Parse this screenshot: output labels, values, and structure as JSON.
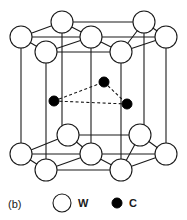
{
  "figure": {
    "panel_label": "(b)",
    "title": "",
    "type": "crystal-structure-diagram",
    "colors": {
      "line": "#1a1a1a",
      "atom_w_fill": "#ffffff",
      "atom_w_stroke": "#1a1a1a",
      "atom_c_fill": "#000000",
      "atom_c_stroke": "#000000",
      "background": "#ffffff",
      "dashed_bond": "#1a1a1a"
    }
  },
  "legend": {
    "items": [
      {
        "symbol": "open-circle",
        "label": "W"
      },
      {
        "symbol": "filled-circle",
        "label": "C"
      }
    ]
  },
  "chart_data": {
    "type": "scatter",
    "xlabel": "",
    "ylabel": "",
    "atoms": [
      {
        "element": "W",
        "layer": "top",
        "cx": 62,
        "cy": 22,
        "r": 11
      },
      {
        "element": "W",
        "layer": "top",
        "cx": 144,
        "cy": 22,
        "r": 11
      },
      {
        "element": "W",
        "layer": "top",
        "cx": 21,
        "cy": 37,
        "r": 11
      },
      {
        "element": "W",
        "layer": "top",
        "cx": 91,
        "cy": 37,
        "r": 11
      },
      {
        "element": "W",
        "layer": "top",
        "cx": 166,
        "cy": 37,
        "r": 11
      },
      {
        "element": "W",
        "layer": "top",
        "cx": 46,
        "cy": 52,
        "r": 11
      },
      {
        "element": "W",
        "layer": "top",
        "cx": 121,
        "cy": 52,
        "r": 11
      },
      {
        "element": "C",
        "layer": "middle",
        "cx": 104,
        "cy": 82,
        "r": 5
      },
      {
        "element": "C",
        "layer": "middle",
        "cx": 54,
        "cy": 101,
        "r": 5
      },
      {
        "element": "C",
        "layer": "middle",
        "cx": 127,
        "cy": 104,
        "r": 5
      },
      {
        "element": "W",
        "layer": "bottom",
        "cx": 68,
        "cy": 135,
        "r": 11
      },
      {
        "element": "W",
        "layer": "bottom",
        "cx": 140,
        "cy": 135,
        "r": 11
      },
      {
        "element": "W",
        "layer": "bottom",
        "cx": 21,
        "cy": 154,
        "r": 11
      },
      {
        "element": "W",
        "layer": "bottom",
        "cx": 91,
        "cy": 154,
        "r": 11
      },
      {
        "element": "W",
        "layer": "bottom",
        "cx": 166,
        "cy": 154,
        "r": 11
      },
      {
        "element": "W",
        "layer": "bottom",
        "cx": 46,
        "cy": 170,
        "r": 11
      },
      {
        "element": "W",
        "layer": "bottom",
        "cx": 121,
        "cy": 170,
        "r": 11
      }
    ],
    "vertical_edges": [
      {
        "x1": 21,
        "y1": 37,
        "x2": 21,
        "y2": 154
      },
      {
        "x1": 46,
        "y1": 52,
        "x2": 46,
        "y2": 170
      },
      {
        "x1": 62,
        "y1": 22,
        "x2": 62,
        "y2": 135
      },
      {
        "x1": 91,
        "y1": 37,
        "x2": 91,
        "y2": 154
      },
      {
        "x1": 121,
        "y1": 52,
        "x2": 121,
        "y2": 170
      },
      {
        "x1": 144,
        "y1": 22,
        "x2": 144,
        "y2": 135
      },
      {
        "x1": 166,
        "y1": 37,
        "x2": 166,
        "y2": 154
      }
    ],
    "top_face_edges": [
      {
        "x1": 62,
        "y1": 22,
        "x2": 144,
        "y2": 22
      },
      {
        "x1": 21,
        "y1": 37,
        "x2": 62,
        "y2": 22
      },
      {
        "x1": 144,
        "y1": 22,
        "x2": 166,
        "y2": 37
      },
      {
        "x1": 21,
        "y1": 37,
        "x2": 91,
        "y2": 37
      },
      {
        "x1": 91,
        "y1": 37,
        "x2": 166,
        "y2": 37
      },
      {
        "x1": 21,
        "y1": 37,
        "x2": 46,
        "y2": 52
      },
      {
        "x1": 46,
        "y1": 52,
        "x2": 121,
        "y2": 52
      },
      {
        "x1": 121,
        "y1": 52,
        "x2": 166,
        "y2": 37
      },
      {
        "x1": 46,
        "y1": 52,
        "x2": 91,
        "y2": 37
      },
      {
        "x1": 91,
        "y1": 37,
        "x2": 121,
        "y2": 52
      },
      {
        "x1": 62,
        "y1": 22,
        "x2": 91,
        "y2": 37
      },
      {
        "x1": 144,
        "y1": 22,
        "x2": 121,
        "y2": 52
      }
    ],
    "bottom_face_edges": [
      {
        "x1": 68,
        "y1": 135,
        "x2": 140,
        "y2": 135
      },
      {
        "x1": 21,
        "y1": 154,
        "x2": 68,
        "y2": 135
      },
      {
        "x1": 140,
        "y1": 135,
        "x2": 166,
        "y2": 154
      },
      {
        "x1": 21,
        "y1": 154,
        "x2": 91,
        "y2": 154
      },
      {
        "x1": 91,
        "y1": 154,
        "x2": 166,
        "y2": 154
      },
      {
        "x1": 21,
        "y1": 154,
        "x2": 46,
        "y2": 170
      },
      {
        "x1": 46,
        "y1": 170,
        "x2": 121,
        "y2": 170
      },
      {
        "x1": 121,
        "y1": 170,
        "x2": 166,
        "y2": 154
      },
      {
        "x1": 46,
        "y1": 170,
        "x2": 91,
        "y2": 154
      },
      {
        "x1": 91,
        "y1": 154,
        "x2": 121,
        "y2": 170
      },
      {
        "x1": 68,
        "y1": 135,
        "x2": 91,
        "y2": 154
      },
      {
        "x1": 140,
        "y1": 135,
        "x2": 121,
        "y2": 170
      }
    ],
    "carbon_bonds": [
      {
        "x1": 54,
        "y1": 101,
        "x2": 104,
        "y2": 82
      },
      {
        "x1": 104,
        "y1": 82,
        "x2": 127,
        "y2": 104
      },
      {
        "x1": 54,
        "y1": 101,
        "x2": 127,
        "y2": 104
      }
    ],
    "legend_marks": [
      {
        "element": "W",
        "cx": 62,
        "cy": 203,
        "r": 9
      },
      {
        "element": "C",
        "cx": 117,
        "cy": 203,
        "r": 5
      }
    ],
    "legend_text": [
      {
        "label": "W",
        "x": 78,
        "y": 207
      },
      {
        "label": "C",
        "x": 129,
        "y": 207
      }
    ],
    "panel_label_pos": {
      "x": 8,
      "y": 208
    }
  }
}
